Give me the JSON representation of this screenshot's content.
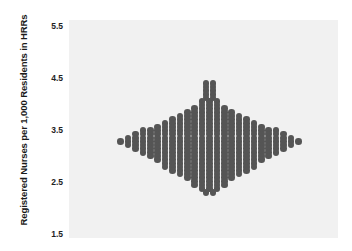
{
  "chart_data": {
    "type": "scatter",
    "subtype": "beeswarm-dot-density",
    "title": "",
    "xlabel": "",
    "ylabel": "Registered Nurses per 1,000 Residents in HRRs",
    "ytick_labels": [
      "5.5",
      "4.5",
      "3.5",
      "2.5",
      "1.5"
    ],
    "ytick_values": [
      5.5,
      4.5,
      3.5,
      2.5,
      1.5
    ],
    "ylim": [
      1.42,
      5.62
    ],
    "xlim": [
      0,
      1
    ],
    "grid": false,
    "legend": null,
    "dot_color": "#555555",
    "plot_background": "#f1f1f1",
    "figure_background": "#ffffff",
    "dot_radius_px": 3.3,
    "n_points": 306,
    "binned_rows": [
      {
        "y": 4.4,
        "count": 2
      },
      {
        "y": 4.33,
        "count": 2
      },
      {
        "y": 4.26,
        "count": 2
      },
      {
        "y": 4.19,
        "count": 2
      },
      {
        "y": 4.12,
        "count": 2
      },
      {
        "y": 4.05,
        "count": 3
      },
      {
        "y": 3.98,
        "count": 3
      },
      {
        "y": 3.91,
        "count": 5
      },
      {
        "y": 3.84,
        "count": 7
      },
      {
        "y": 3.77,
        "count": 9
      },
      {
        "y": 3.7,
        "count": 11
      },
      {
        "y": 3.63,
        "count": 13
      },
      {
        "y": 3.56,
        "count": 15
      },
      {
        "y": 3.49,
        "count": 19
      },
      {
        "y": 3.42,
        "count": 21
      },
      {
        "y": 3.35,
        "count": 23
      },
      {
        "y": 3.28,
        "count": 25
      },
      {
        "y": 3.21,
        "count": 23
      },
      {
        "y": 3.14,
        "count": 21
      },
      {
        "y": 3.07,
        "count": 19
      },
      {
        "y": 3.0,
        "count": 17
      },
      {
        "y": 2.93,
        "count": 15
      },
      {
        "y": 2.86,
        "count": 13
      },
      {
        "y": 2.79,
        "count": 13
      },
      {
        "y": 2.72,
        "count": 11
      },
      {
        "y": 2.65,
        "count": 9
      },
      {
        "y": 2.58,
        "count": 7
      },
      {
        "y": 2.51,
        "count": 5
      },
      {
        "y": 2.44,
        "count": 5
      },
      {
        "y": 2.37,
        "count": 3
      },
      {
        "y": 2.3,
        "count": 2
      }
    ]
  },
  "axis": {
    "y_label": "Registered Nurses per 1,000 Residents in HRRs",
    "ticks": [
      {
        "label": "5.5",
        "value": 5.5
      },
      {
        "label": "4.5",
        "value": 4.5
      },
      {
        "label": "3.5",
        "value": 3.5
      },
      {
        "label": "2.5",
        "value": 2.5
      },
      {
        "label": "1.5",
        "value": 1.5
      }
    ]
  }
}
